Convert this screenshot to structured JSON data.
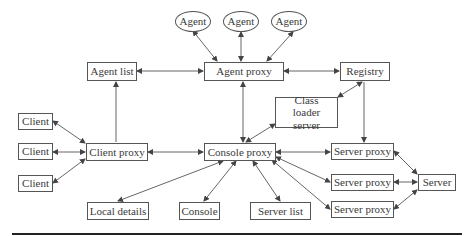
{
  "diagram": {
    "nodes": {
      "agent1": "Agent",
      "agent2": "Agent",
      "agent3": "Agent",
      "agent_list": "Agent list",
      "agent_proxy": "Agent proxy",
      "registry": "Registry",
      "class_loader_server": "Class loader server",
      "client1": "Client",
      "client2": "Client",
      "client3": "Client",
      "client_proxy": "Client proxy",
      "console_proxy": "Console proxy",
      "server_proxy1": "Server proxy",
      "server_proxy2": "Server proxy",
      "server_proxy3": "Server proxy",
      "server": "Server",
      "local_details": "Local details",
      "console": "Console",
      "server_list": "Server list"
    },
    "edges": [
      [
        "agent1",
        "agent_proxy",
        "bidirectional"
      ],
      [
        "agent2",
        "agent_proxy",
        "bidirectional"
      ],
      [
        "agent3",
        "agent_proxy",
        "bidirectional"
      ],
      [
        "agent_list",
        "agent_proxy",
        "bidirectional"
      ],
      [
        "agent_proxy",
        "registry",
        "bidirectional"
      ],
      [
        "agent_list",
        "client_proxy",
        "directed"
      ],
      [
        "agent_proxy",
        "console_proxy",
        "bidirectional"
      ],
      [
        "class_loader_server",
        "registry",
        "bidirectional"
      ],
      [
        "class_loader_server",
        "console_proxy",
        "bidirectional"
      ],
      [
        "registry",
        "server_proxy1",
        "directed"
      ],
      [
        "client1",
        "client_proxy",
        "bidirectional"
      ],
      [
        "client2",
        "client_proxy",
        "bidirectional"
      ],
      [
        "client3",
        "client_proxy",
        "bidirectional"
      ],
      [
        "client_proxy",
        "console_proxy",
        "bidirectional"
      ],
      [
        "console_proxy",
        "server_proxy1",
        "bidirectional"
      ],
      [
        "console_proxy",
        "server_proxy2",
        "bidirectional"
      ],
      [
        "console_proxy",
        "server_proxy3",
        "bidirectional"
      ],
      [
        "console_proxy",
        "local_details",
        "bidirectional"
      ],
      [
        "console_proxy",
        "console",
        "bidirectional"
      ],
      [
        "console_proxy",
        "server_list",
        "bidirectional"
      ],
      [
        "server_proxy1",
        "server",
        "bidirectional"
      ],
      [
        "server_proxy2",
        "server",
        "bidirectional"
      ],
      [
        "server_proxy3",
        "server",
        "bidirectional"
      ]
    ],
    "colors": {
      "stroke": "#555555",
      "text": "#3a3a3a",
      "rule": "#222222"
    }
  }
}
